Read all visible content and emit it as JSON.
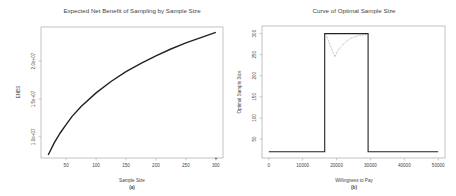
{
  "chart_data": [
    {
      "type": "line",
      "panel": "(a)",
      "title": "Expected Net Benefit of Sampling by Sample Size",
      "xlabel": "Sample Size",
      "ylabel": "ENBS",
      "x_ticks": [
        "50",
        "100",
        "150",
        "200",
        "250",
        "300"
      ],
      "y_ticks": [
        "1.0e+07",
        "1.5e+07",
        "2.0e+07"
      ],
      "xlim": [
        8,
        312
      ],
      "ylim": [
        7200000,
        24500000
      ],
      "grid": false,
      "series": [
        {
          "name": "ENBS",
          "style": "solid",
          "x": [
            20,
            30,
            40,
            50,
            60,
            75,
            100,
            125,
            150,
            175,
            200,
            225,
            250,
            275,
            300
          ],
          "y": [
            7600000,
            9200000,
            10500000,
            11600000,
            12700000,
            14000000,
            15800000,
            17300000,
            18600000,
            19700000,
            20700000,
            21600000,
            22400000,
            23100000,
            23800000
          ]
        }
      ],
      "annotations": [
        {
          "x": 300,
          "y": 7400000,
          "mark": "+"
        }
      ]
    },
    {
      "type": "line",
      "panel": "(b)",
      "title": "Curve of Optimal Sample Size",
      "xlabel": "Willingness to Pay",
      "ylabel": "Optimal Sample Size",
      "x_ticks": [
        "0",
        "10000",
        "20000",
        "30000",
        "40000",
        "50000"
      ],
      "y_ticks": [
        "50",
        "100",
        "150",
        "200",
        "250",
        "300"
      ],
      "xlim": [
        -2000,
        52000
      ],
      "ylim": [
        5,
        318
      ],
      "grid": false,
      "series": [
        {
          "name": "Optimal sample size",
          "style": "solid",
          "x": [
            0,
            16500,
            16500,
            29300,
            29300,
            50000
          ],
          "y": [
            20,
            20,
            300,
            300,
            20,
            20
          ]
        },
        {
          "name": "Alternative curve",
          "style": "dotted",
          "x": [
            17000,
            18000,
            19000,
            19500,
            20500,
            22000,
            23000,
            24000,
            25500,
            27000,
            29000
          ],
          "y": [
            295,
            275,
            255,
            245,
            262,
            275,
            282,
            288,
            293,
            296,
            298
          ]
        }
      ]
    }
  ]
}
